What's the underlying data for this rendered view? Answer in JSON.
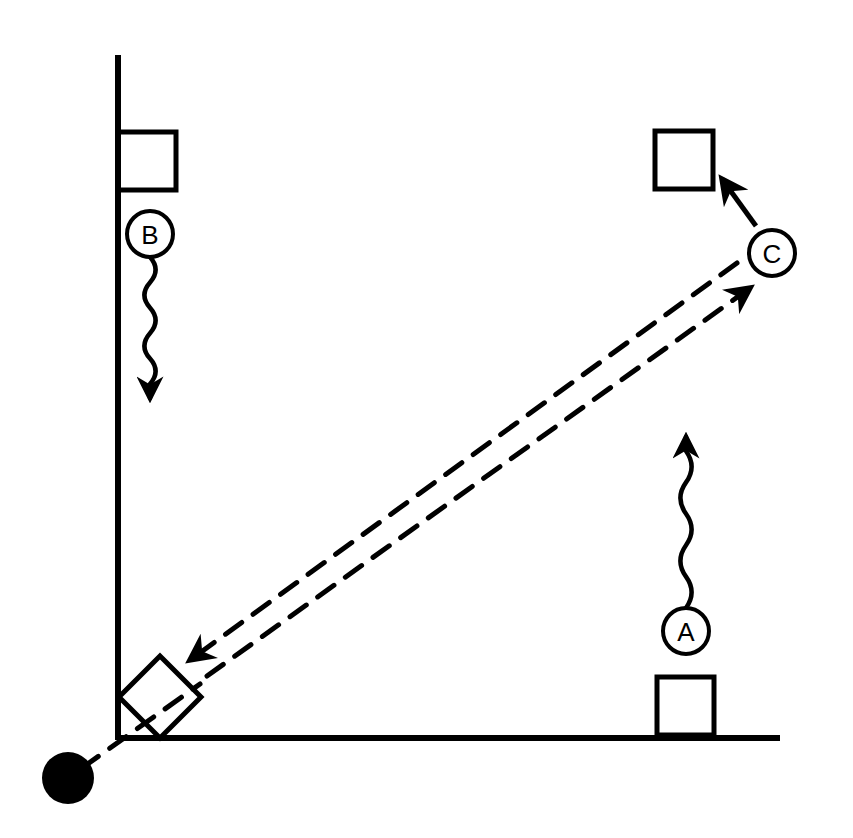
{
  "diagram": {
    "background": "#ffffff",
    "ink": "#000000",
    "axes": {
      "vertical": {
        "x": 118,
        "y1": 55,
        "y2": 740
      },
      "horizontal": {
        "y": 738,
        "x1": 118,
        "x2": 780
      }
    },
    "squares": [
      {
        "id": "top-left",
        "x": 118,
        "y": 132,
        "w": 58,
        "h": 58
      },
      {
        "id": "top-right",
        "x": 655,
        "y": 131,
        "w": 58,
        "h": 58
      },
      {
        "id": "bottom-right",
        "x": 657,
        "y": 677,
        "w": 57,
        "h": 58
      }
    ],
    "tilted_square": {
      "cx": 160,
      "cy": 697,
      "size": 58,
      "angle": -45
    },
    "source_dot": {
      "cx": 68,
      "cy": 778,
      "r": 26
    },
    "labels": [
      {
        "id": "B",
        "text": "B",
        "cx": 150,
        "cy": 234,
        "r": 23
      },
      {
        "id": "C",
        "text": "C",
        "cx": 772,
        "cy": 253,
        "r": 23
      },
      {
        "id": "A",
        "text": "A",
        "cx": 686,
        "cy": 631,
        "r": 23
      }
    ],
    "wavy_arrows": [
      {
        "id": "wave-from-B",
        "direction": "down",
        "x": 150,
        "y_start": 257,
        "y_end": 398
      },
      {
        "id": "wave-from-A",
        "direction": "up",
        "x": 686,
        "y_start": 608,
        "y_end": 437
      }
    ],
    "straight_arrow": {
      "id": "C-to-square",
      "x1": 756,
      "y1": 226,
      "x2": 722,
      "y2": 179
    },
    "dashed_lines": [
      {
        "id": "dashed-down-left",
        "x1": 737,
        "y1": 263,
        "x2": 190,
        "y2": 660,
        "arrow": "end"
      },
      {
        "id": "dashed-up-right",
        "x1": 207,
        "y1": 676,
        "x2": 750,
        "y2": 288,
        "arrow": "end"
      },
      {
        "id": "dashed-source",
        "x1": 82,
        "y1": 768,
        "x2": 200,
        "y2": 684,
        "arrow": "none"
      }
    ]
  }
}
